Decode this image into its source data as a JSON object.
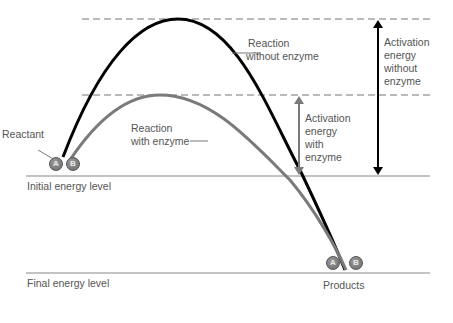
{
  "diagram": {
    "levels": {
      "initial": "Initial energy level",
      "final": "Final energy level"
    },
    "labels": {
      "reactant": "Reactant",
      "products": "Products",
      "reaction_without": [
        "Reaction",
        "without enzyme"
      ],
      "reaction_with": [
        "Reaction",
        "with enzyme"
      ],
      "activation_with": [
        "Activation",
        "energy",
        "with",
        "enzyme"
      ],
      "activation_without": [
        "Activation",
        "energy",
        "without",
        "enzyme"
      ]
    },
    "molecules": {
      "reactant": [
        "A",
        "B"
      ],
      "products": [
        "A",
        "B"
      ]
    },
    "colors": {
      "without_enzyme_curve": "#000000",
      "with_enzyme_curve": "#7a7a7a",
      "level_lines": "#888888",
      "dashed_lines": "#777777",
      "text": "#555555"
    }
  }
}
